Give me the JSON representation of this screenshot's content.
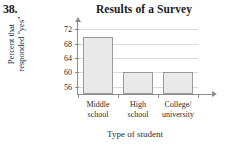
{
  "problem": {
    "number": "38."
  },
  "chart_data": {
    "type": "bar",
    "title": "Results of a Survey",
    "xlabel": "Type of student",
    "ylabel_line1": "Percent that",
    "ylabel_line2": "responded \"yes\"",
    "categories": [
      "Middle school",
      "High school",
      "College/ university"
    ],
    "category_lines": [
      [
        "Middle",
        "school"
      ],
      [
        "High",
        "school"
      ],
      [
        "College/",
        "university"
      ]
    ],
    "values": [
      70,
      60,
      60
    ],
    "yticks": [
      72,
      68,
      64,
      60,
      56
    ],
    "ylim": [
      54,
      73.5
    ],
    "grid": true,
    "legend": "none",
    "bar_fill": "#e9e9e9",
    "bar_border": "#9a9a9a",
    "grid_color": "#d9d9d9",
    "axis_color": "#8d8d8d"
  }
}
